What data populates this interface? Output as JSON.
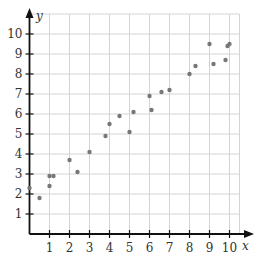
{
  "chart_data": {
    "type": "scatter",
    "title": "",
    "xlabel": "x",
    "ylabel": "y",
    "xlim": [
      0,
      10.5
    ],
    "ylim": [
      0,
      11
    ],
    "grid": true,
    "legend": null,
    "x_ticks": [
      1,
      2,
      3,
      4,
      5,
      6,
      7,
      8,
      9,
      10
    ],
    "y_ticks": [
      1,
      2,
      3,
      4,
      5,
      6,
      7,
      8,
      9,
      10
    ],
    "x_tick_labels": [
      "1",
      "2",
      "3",
      "4",
      "5",
      "6",
      "7",
      "8",
      "9",
      "10"
    ],
    "y_tick_labels": [
      "1",
      "2",
      "3",
      "4",
      "5",
      "6",
      "7",
      "8",
      "9",
      "10"
    ],
    "points": [
      {
        "x": 0.0,
        "y": 2.3
      },
      {
        "x": 0.5,
        "y": 1.8
      },
      {
        "x": 1.0,
        "y": 2.9
      },
      {
        "x": 1.2,
        "y": 2.9
      },
      {
        "x": 1.0,
        "y": 2.4
      },
      {
        "x": 2.0,
        "y": 3.7
      },
      {
        "x": 2.4,
        "y": 3.1
      },
      {
        "x": 3.0,
        "y": 4.1
      },
      {
        "x": 3.8,
        "y": 4.9
      },
      {
        "x": 4.0,
        "y": 5.5
      },
      {
        "x": 4.5,
        "y": 5.9
      },
      {
        "x": 5.0,
        "y": 5.1
      },
      {
        "x": 5.2,
        "y": 6.1
      },
      {
        "x": 6.0,
        "y": 6.9
      },
      {
        "x": 6.1,
        "y": 6.2
      },
      {
        "x": 6.6,
        "y": 7.1
      },
      {
        "x": 7.0,
        "y": 7.2
      },
      {
        "x": 8.0,
        "y": 8.0
      },
      {
        "x": 8.3,
        "y": 8.4
      },
      {
        "x": 9.0,
        "y": 9.5
      },
      {
        "x": 9.2,
        "y": 8.5
      },
      {
        "x": 9.8,
        "y": 8.7
      },
      {
        "x": 9.9,
        "y": 9.4
      },
      {
        "x": 10.0,
        "y": 9.5
      }
    ],
    "colors": {
      "point": "#777777",
      "grid": "#d4d4d4",
      "axis": "#111111"
    }
  }
}
